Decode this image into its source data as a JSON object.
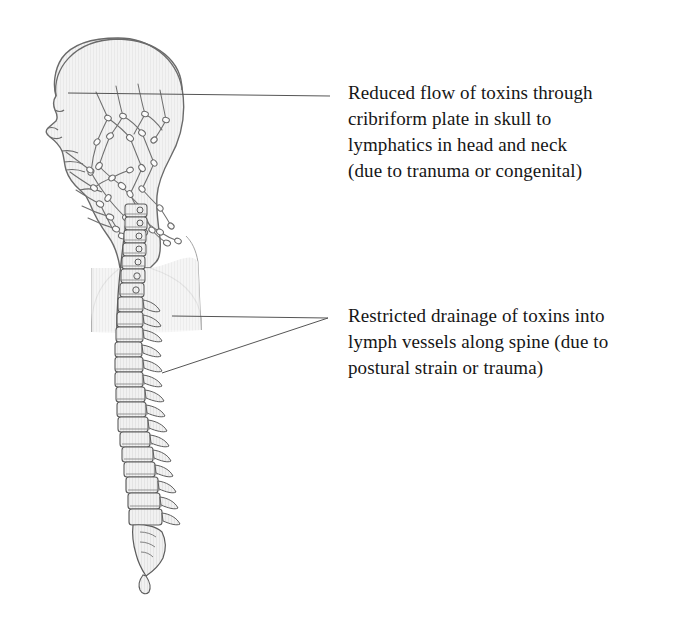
{
  "figure": {
    "view": "lateral (side) profile facing left",
    "style": "line drawing with light gray halftone fill"
  },
  "colors": {
    "background": "#ffffff",
    "body_fill": "#f2f2f2",
    "outline_stroke": "#6a6a6a",
    "bone_stroke": "#5d5d5d",
    "vessel_stroke": "#6f6f6f",
    "leader_line": "#555555",
    "text": "#161616"
  },
  "callouts": [
    {
      "id": "cranial",
      "text": "Reduced flow of toxins through\ncribriform plate in skull to\nlymphatics in head and neck\n(due to tranuma or congenital)",
      "lines": [
        "Reduced flow of toxins through",
        "cribriform plate in skull to",
        "lymphatics in head and neck",
        "(due to tranuma or congenital)"
      ],
      "points_to": "cranial lymphatic network inside skull",
      "leader_count": 1
    },
    {
      "id": "spinal",
      "text": "Restricted drainage of toxins into\nlymph vessels along spine (due to\npostural strain or trauma)",
      "lines": [
        "Restricted drainage of toxins into",
        "lymph vessels along spine (due to",
        "postural strain or trauma)"
      ],
      "points_to": "thoracic and lumbar vertebrae along spine",
      "leader_count": 2
    }
  ],
  "anatomy_labels": {
    "head": "head-profile",
    "skull": "skull-dome",
    "face": "facial-profile",
    "neck": "neck-outline",
    "shoulder": "shoulder-outline",
    "lymphatics": "cranial-lymphatic-network",
    "lymph_nodes": "lymph-nodes",
    "cervical": "cervical-vertebrae",
    "thoracic": "thoracic-vertebrae",
    "lumbar": "lumbar-vertebrae",
    "sacrum": "sacrum",
    "coccyx": "coccyx"
  }
}
